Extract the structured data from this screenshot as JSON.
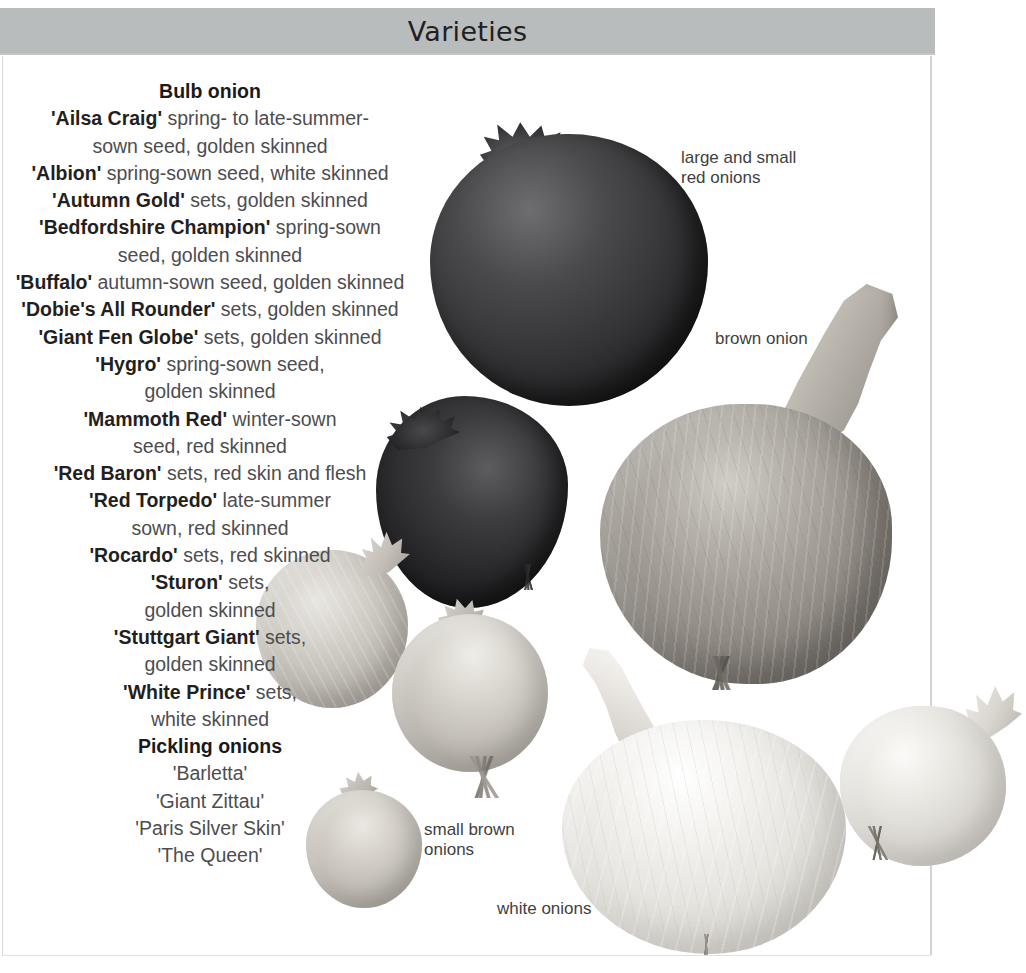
{
  "header": {
    "title": "Varieties"
  },
  "varieties": {
    "sections": [
      {
        "heading": "Bulb onion",
        "entries": [
          {
            "name": "'Ailsa Craig'",
            "desc": " spring- to late-summer-",
            "cont": "sown seed, golden skinned"
          },
          {
            "name": "'Albion'",
            "desc": " spring-sown seed, white skinned",
            "cont": ""
          },
          {
            "name": "'Autumn Gold'",
            "desc": " sets, golden skinned",
            "cont": ""
          },
          {
            "name": "'Bedfordshire Champion'",
            "desc": " spring-sown",
            "cont": "seed, golden skinned"
          },
          {
            "name": "'Buffalo'",
            "desc": " autumn-sown seed, golden skinned",
            "cont": ""
          },
          {
            "name": "'Dobie's All Rounder'",
            "desc": " sets, golden skinned",
            "cont": ""
          },
          {
            "name": "'Giant Fen Globe'",
            "desc": " sets, golden skinned",
            "cont": ""
          },
          {
            "name": "'Hygro'",
            "desc": " spring-sown seed,",
            "cont": "golden skinned"
          },
          {
            "name": "'Mammoth Red'",
            "desc": " winter-sown",
            "cont": "seed, red skinned"
          },
          {
            "name": "'Red Baron'",
            "desc": " sets, red skin and flesh",
            "cont": ""
          },
          {
            "name": "'Red Torpedo'",
            "desc": " late-summer",
            "cont": "sown, red skinned"
          },
          {
            "name": "'Rocardo'",
            "desc": " sets, red skinned",
            "cont": ""
          },
          {
            "name": "'Sturon'",
            "desc": " sets,",
            "cont": "golden skinned"
          },
          {
            "name": "'Stuttgart Giant'",
            "desc": " sets,",
            "cont": "golden skinned"
          },
          {
            "name": "'White Prince'",
            "desc": " sets,",
            "cont": "white skinned"
          }
        ]
      },
      {
        "heading": "Pickling onions",
        "plain_entries": [
          "'Barletta'",
          "'Giant Zittau'",
          "'Paris Silver Skin'",
          "'The Queen'"
        ]
      }
    ]
  },
  "captions": {
    "red_onions": "large and small\nred onions",
    "brown_onion": "brown onion",
    "small_brown_onions": "small brown\nonions",
    "white_onions": "white onions"
  },
  "photos": [
    {
      "name": "large-red-onion",
      "label": "large red onion"
    },
    {
      "name": "small-red-onion",
      "label": "small red onion"
    },
    {
      "name": "brown-onion",
      "label": "brown onion"
    },
    {
      "name": "small-brown-onion-left",
      "label": "small brown onion"
    },
    {
      "name": "small-brown-onion-middle",
      "label": "small brown onion"
    },
    {
      "name": "small-brown-onion-bottom",
      "label": "small brown onion"
    },
    {
      "name": "large-white-onion",
      "label": "white onion"
    },
    {
      "name": "right-white-onion",
      "label": "white onion"
    }
  ],
  "colors": {
    "header_band": "#b9bcbd",
    "heading_text": "#1a1a1a",
    "body_text": "#4d4d4f",
    "caption_text": "#3f3f41",
    "page_background": "#ffffff",
    "rule": "#d4d4d4"
  }
}
